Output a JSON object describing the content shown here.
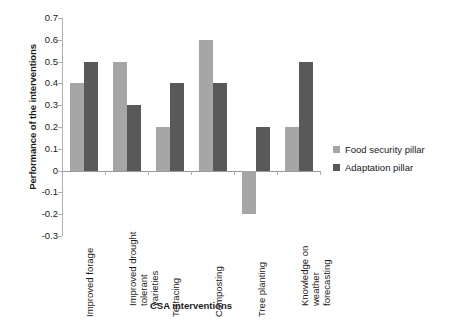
{
  "chart_data": {
    "type": "bar",
    "title": "",
    "xlabel": "CSA interventions",
    "ylabel": "Performance of the interventions",
    "categories": [
      "Improved forage",
      "Improved drought tolerant varieties",
      "Terracing",
      "Composting",
      "Tree planting",
      "Knowledge on weather forecasting"
    ],
    "series": [
      {
        "name": "Food security pillar",
        "color": "#a6a6a6",
        "values": [
          0.4,
          0.5,
          0.2,
          0.6,
          -0.2,
          0.2
        ]
      },
      {
        "name": "Adaptation pillar",
        "color": "#595959",
        "values": [
          0.5,
          0.3,
          0.4,
          0.4,
          0.2,
          0.5
        ]
      }
    ],
    "ylim": [
      -0.3,
      0.7
    ],
    "yticks": [
      0.7,
      0.6,
      0.5,
      0.4,
      0.3,
      0.2,
      0.1,
      0,
      -0.1,
      -0.2,
      -0.3
    ],
    "ytick_labels": [
      "0.7",
      "0.6",
      "0.5",
      "0.4",
      "0.3",
      "0.2",
      "0.1",
      "0",
      "-0.1",
      "-0.2",
      "-0.3"
    ],
    "grid": false,
    "legend_position": "right",
    "background": "#ffffff"
  },
  "legend": {
    "items": [
      {
        "label": "Food security pillar",
        "color": "#a6a6a6"
      },
      {
        "label": "Adaptation pillar",
        "color": "#595959"
      }
    ]
  }
}
